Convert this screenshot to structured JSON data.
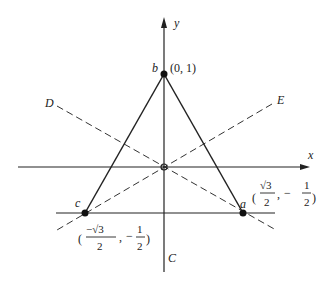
{
  "figure": {
    "axes": {
      "x_label": "x",
      "y_label": "y"
    },
    "lines": {
      "D_label": "D",
      "E_label": "E",
      "C_label": "C"
    },
    "points": {
      "b": {
        "name": "b",
        "coord": "(0, 1)"
      },
      "a": {
        "name": "a",
        "coord_x_num": "√3",
        "coord_x_den": "2",
        "coord_y_sign": "−",
        "coord_y_num": "1",
        "coord_y_den": "2"
      },
      "c": {
        "name": "c",
        "coord_x_num": "−√3",
        "coord_x_den": "2",
        "coord_y_sign": "−",
        "coord_y_num": "1",
        "coord_y_den": "2"
      }
    },
    "colors": {
      "ink": "#222222",
      "background": "#ffffff"
    }
  }
}
